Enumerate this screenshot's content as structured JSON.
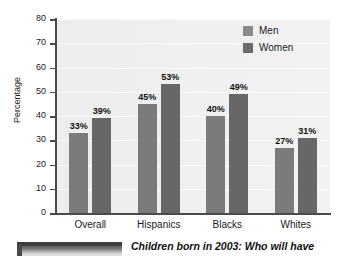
{
  "chart_data": {
    "type": "bar",
    "title": "",
    "categories": [
      "Overall",
      "Hispanics",
      "Blacks",
      "Whites"
    ],
    "series": [
      {
        "name": "Men",
        "values": [
          33,
          45,
          40,
          27
        ],
        "color": "#7b7b7b",
        "labels": [
          "33%",
          "45%",
          "40%",
          "27%"
        ]
      },
      {
        "name": "Women",
        "values": [
          39,
          53,
          49,
          31
        ],
        "color": "#676767",
        "labels": [
          "39%",
          "53%",
          "49%",
          "31%"
        ]
      }
    ],
    "xlabel": "",
    "ylabel": "Percentage",
    "ylim": [
      0,
      80
    ],
    "yticks": [
      0,
      10,
      20,
      30,
      40,
      50,
      60,
      70,
      80
    ],
    "ytick_labels": [
      "0",
      "10",
      "20",
      "30",
      "40",
      "50",
      "60",
      "70",
      "80"
    ],
    "grid": true,
    "grid_axis": "y",
    "legend_position": "top-right",
    "bar_value_labels": true
  },
  "legend": {
    "entries": [
      {
        "label": "Men",
        "swatch": "legend-swatch-men"
      },
      {
        "label": "Women",
        "swatch": "legend-swatch-women"
      }
    ]
  },
  "caption": {
    "text": "Children born in 2003: Who will have"
  }
}
